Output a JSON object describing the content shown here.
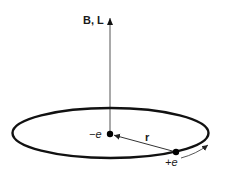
{
  "diagram": {
    "axis_label": "B, L",
    "center_charge_label": "−e",
    "orbit_charge_label": "+e",
    "radius_label": "r",
    "colors": {
      "line": "#111111",
      "axis": "#555555",
      "background": "#ffffff"
    },
    "elements": [
      {
        "id": "axis-arrow",
        "type": "vector",
        "label": "B, L",
        "direction": "up"
      },
      {
        "id": "orbit",
        "type": "ellipse",
        "label": "circular orbit (perspective)"
      },
      {
        "id": "center-charge",
        "type": "point",
        "label": "−e"
      },
      {
        "id": "orbit-charge",
        "type": "point",
        "label": "+e"
      },
      {
        "id": "radius-vector",
        "type": "vector",
        "label": "r",
        "from": "orbit-charge",
        "to": "center-charge"
      },
      {
        "id": "motion-arrow",
        "type": "curved-arrow",
        "label": "direction of motion"
      }
    ]
  }
}
